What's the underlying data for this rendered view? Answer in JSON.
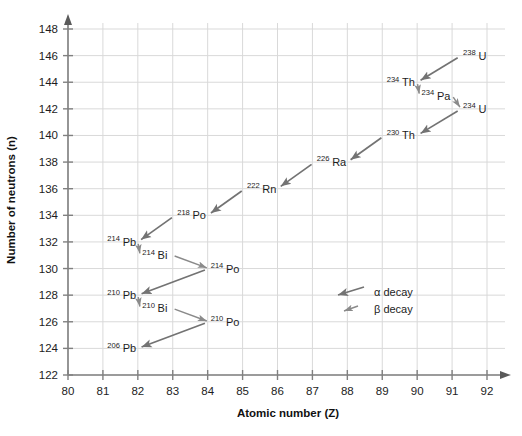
{
  "chart_data": {
    "type": "scatter",
    "title": "",
    "xlabel": "Atomic number (Z)",
    "ylabel": "Number of neutrons (n)",
    "xlim": [
      80,
      92
    ],
    "ylim": [
      122,
      148
    ],
    "xticks": [
      "80",
      "81",
      "82",
      "83",
      "84",
      "85",
      "86",
      "87",
      "88",
      "89",
      "90",
      "91",
      "92"
    ],
    "yticks": [
      "122",
      "124",
      "126",
      "128",
      "130",
      "132",
      "134",
      "136",
      "138",
      "140",
      "142",
      "144",
      "146",
      "148"
    ],
    "grid": true,
    "legend_position": "inside-center-right",
    "nuclides": [
      {
        "mass": "238",
        "symbol": "U",
        "z": 92,
        "n": 146,
        "anchor": "end"
      },
      {
        "mass": "234",
        "symbol": "Th",
        "z": 90,
        "n": 144,
        "anchor": "end"
      },
      {
        "mass": "234",
        "symbol": "Pa",
        "z": 91,
        "n": 143,
        "anchor": "end"
      },
      {
        "mass": "234",
        "symbol": "U",
        "z": 92,
        "n": 142,
        "anchor": "end"
      },
      {
        "mass": "230",
        "symbol": "Th",
        "z": 90,
        "n": 140,
        "anchor": "end"
      },
      {
        "mass": "226",
        "symbol": "Ra",
        "z": 88,
        "n": 138,
        "anchor": "end"
      },
      {
        "mass": "222",
        "symbol": "Rn",
        "z": 86,
        "n": 136,
        "anchor": "end"
      },
      {
        "mass": "218",
        "symbol": "Po",
        "z": 84,
        "n": 134,
        "anchor": "end"
      },
      {
        "mass": "214",
        "symbol": "Pb",
        "z": 82,
        "n": 132,
        "anchor": "end"
      },
      {
        "mass": "214",
        "symbol": "Bi",
        "z": 83,
        "n": 131,
        "anchor": "end"
      },
      {
        "mass": "214",
        "symbol": "Po",
        "z": 84,
        "n": 130,
        "anchor": "start"
      },
      {
        "mass": "210",
        "symbol": "Pb",
        "z": 82,
        "n": 128,
        "anchor": "end"
      },
      {
        "mass": "210",
        "symbol": "Bi",
        "z": 83,
        "n": 127,
        "anchor": "end"
      },
      {
        "mass": "210",
        "symbol": "Po",
        "z": 84,
        "n": 126,
        "anchor": "start"
      },
      {
        "mass": "206",
        "symbol": "Pb",
        "z": 82,
        "n": 124,
        "anchor": "end"
      }
    ],
    "decays": [
      {
        "from": "238U",
        "to": "234Th",
        "type": "alpha",
        "fz": 92,
        "fn": 146,
        "tz": 90,
        "tn": 144
      },
      {
        "from": "234Th",
        "to": "234Pa",
        "type": "beta",
        "fz": 90,
        "fn": 144,
        "tz": 91,
        "tn": 143
      },
      {
        "from": "234Pa",
        "to": "234U",
        "type": "beta",
        "fz": 91,
        "fn": 143,
        "tz": 92,
        "tn": 142
      },
      {
        "from": "234U",
        "to": "230Th",
        "type": "alpha",
        "fz": 92,
        "fn": 142,
        "tz": 90,
        "tn": 140
      },
      {
        "from": "230Th",
        "to": "226Ra",
        "type": "alpha",
        "fz": 90,
        "fn": 140,
        "tz": 88,
        "tn": 138
      },
      {
        "from": "226Ra",
        "to": "222Rn",
        "type": "alpha",
        "fz": 88,
        "fn": 138,
        "tz": 86,
        "tn": 136
      },
      {
        "from": "222Rn",
        "to": "218Po",
        "type": "alpha",
        "fz": 86,
        "fn": 136,
        "tz": 84,
        "tn": 134
      },
      {
        "from": "218Po",
        "to": "214Pb",
        "type": "alpha",
        "fz": 84,
        "fn": 134,
        "tz": 82,
        "tn": 132
      },
      {
        "from": "214Pb",
        "to": "214Bi",
        "type": "beta",
        "fz": 82,
        "fn": 132,
        "tz": 83,
        "tn": 131
      },
      {
        "from": "214Bi",
        "to": "214Po",
        "type": "beta",
        "fz": 83,
        "fn": 131,
        "tz": 84,
        "tn": 130
      },
      {
        "from": "214Po",
        "to": "210Pb",
        "type": "alpha",
        "fz": 84,
        "fn": 130,
        "tz": 82,
        "tn": 128
      },
      {
        "from": "210Pb",
        "to": "210Bi",
        "type": "beta",
        "fz": 82,
        "fn": 128,
        "tz": 83,
        "tn": 127
      },
      {
        "from": "210Bi",
        "to": "210Po",
        "type": "beta",
        "fz": 83,
        "fn": 127,
        "tz": 84,
        "tn": 126
      },
      {
        "from": "210Po",
        "to": "206Pb",
        "type": "alpha",
        "fz": 84,
        "fn": 126,
        "tz": 82,
        "tn": 124
      }
    ],
    "legend": [
      {
        "key": "alpha",
        "label": "α decay"
      },
      {
        "key": "beta",
        "label": "β decay"
      }
    ],
    "colors": {
      "arrow": "#737373",
      "grid": "#d9d9d9",
      "axis": "#808080",
      "text": "#1d1d1d",
      "background": "#ffffff"
    }
  }
}
